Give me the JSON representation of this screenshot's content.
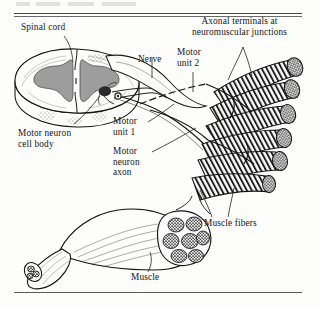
{
  "figure": {
    "kind": "anatomical-illustration",
    "style": "black-and-white line engraving with stipple shading",
    "rules": {
      "top": "double horizontal rule",
      "bottom": "single horizontal rule"
    },
    "cutoff_text_top": ""
  },
  "labels": {
    "spinal_cord": "Spinal cord",
    "nerve": "Nerve",
    "motor_unit_2": "Motor\nunit 2",
    "axonal_terminals": "Axonal terminals at\nneuromuscular junctions",
    "motor_neuron_cell_body": "Motor neuron\ncell body",
    "motor_unit_1": "Motor\nunit 1",
    "motor_neuron_axon": "Motor\nneuron\naxon",
    "muscle_fibers": "Muscle fibers",
    "muscle": "Muscle"
  },
  "colors": {
    "ink": "#141414",
    "gray_matter": "#9a9a9a",
    "paper": "#fdfdfb",
    "rule": "#4a4a4a"
  },
  "parts": {
    "spinal_cord_section": "transverse section with butterfly-shaped gray matter",
    "ventral_roots": "rootlets emerging ventrolaterally joining the nerve",
    "nerve_trunk": "peripheral nerve running to the muscle",
    "muscle_fiber_group": "splayed cylindrical striated muscle fibers",
    "muscle_belly": "fusiform muscle with tendons and cut fascicle cross-section"
  }
}
